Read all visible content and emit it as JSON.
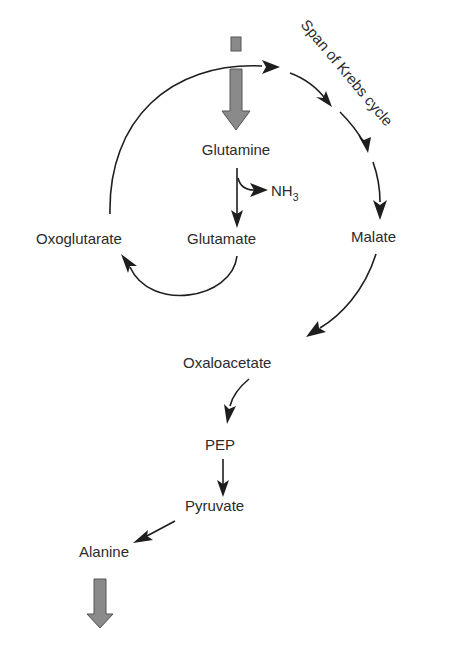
{
  "diagram": {
    "cycle_label": "Span of Krebs cycle",
    "nodes": {
      "glutamine": "Glutamine",
      "nh3_base": "NH",
      "nh3_sub": "3",
      "glutamate": "Glutamate",
      "oxoglutarate": "Oxoglutarate",
      "malate": "Malate",
      "oxaloacetate": "Oxaloacetate",
      "pep": "PEP",
      "pyruvate": "Pyruvate",
      "alanine": "Alanine"
    },
    "edges": [
      {
        "from": "input",
        "to": "Glutamine",
        "style": "block-arrow"
      },
      {
        "from": "Glutamine",
        "to": "Glutamate",
        "side_product": "NH3"
      },
      {
        "from": "Glutamate",
        "to": "Oxoglutarate"
      },
      {
        "from": "Oxoglutarate",
        "to": "Malate",
        "via": "Span of Krebs cycle"
      },
      {
        "from": "Malate",
        "to": "Oxaloacetate"
      },
      {
        "from": "Oxaloacetate",
        "to": "PEP"
      },
      {
        "from": "PEP",
        "to": "Pyruvate"
      },
      {
        "from": "Pyruvate",
        "to": "Alanine"
      },
      {
        "from": "Alanine",
        "to": "output",
        "style": "block-arrow"
      }
    ],
    "colors": {
      "block_arrow_fill": "#8a8a8a",
      "line": "#1e1e1e",
      "text": "#2b2b2b"
    }
  }
}
